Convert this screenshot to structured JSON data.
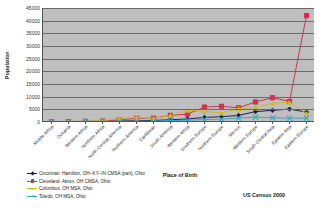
{
  "chart_data": {
    "type": "line",
    "title": "",
    "xlabel": "Place of Birth",
    "ylabel": "Population",
    "ylim": [
      0,
      45000
    ],
    "ytick_step": 5000,
    "yticks": [
      0,
      5000,
      10000,
      15000,
      20000,
      25000,
      30000,
      35000,
      40000,
      45000
    ],
    "grid": true,
    "grid_axis": "y",
    "legend_position": "bottom-left",
    "plot_background": "#bfbfbf",
    "categories": [
      "Middle Africa",
      "Oceania",
      "Western Africa",
      "Northern Africa",
      "North Central America",
      "Northern America",
      "Caribbean",
      "South America",
      "Western Africa",
      "Southern Europe",
      "Northern Europe",
      "Mexico",
      "Western Europe",
      "South Central Asia",
      "Eastern Asia",
      "Eastern Europe"
    ],
    "series": [
      {
        "name": "Cincinnati- Hamilton, OH--KY--IN CMSA (part), Ohio",
        "color": "#1f1f4d",
        "marker": "diamond",
        "values": [
          60,
          120,
          200,
          260,
          400,
          520,
          620,
          900,
          1200,
          1800,
          2100,
          2600,
          4100,
          4600,
          5100,
          3900
        ]
      },
      {
        "name": "Cleveland- Akron, OH CMSA, Ohio",
        "color": "#cc3355",
        "marker": "square",
        "values": [
          80,
          150,
          260,
          380,
          900,
          1400,
          1500,
          2600,
          3100,
          5900,
          6200,
          5600,
          7900,
          9600,
          8100,
          42000
        ]
      },
      {
        "name": "Columbus, OH MSA, Ohio",
        "color": "#ccbb22",
        "marker": "triangle",
        "values": [
          100,
          200,
          320,
          500,
          1500,
          1800,
          1400,
          2500,
          4700,
          4200,
          3600,
          5300,
          5700,
          7400,
          7800,
          3400
        ]
      },
      {
        "name": "Toledo, OH MSA, Ohio",
        "color": "#33aacc",
        "marker": "x",
        "values": [
          30,
          50,
          90,
          130,
          260,
          340,
          300,
          520,
          700,
          950,
          1100,
          1600,
          1900,
          1700,
          1500,
          1500
        ]
      }
    ]
  },
  "axes": {
    "y_title": "Population",
    "x_title": "Place of Birth"
  },
  "source_note": "US Census 2000"
}
